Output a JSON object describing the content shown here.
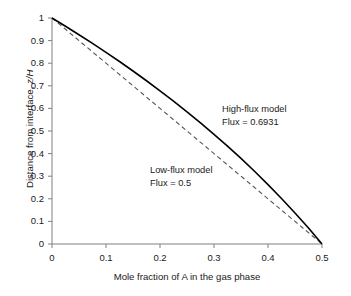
{
  "chart_data": {
    "type": "line",
    "title": "",
    "xlabel": "Mole fraction of A in the gas phase",
    "ylabel": "Distance from interface, z/H",
    "ylabel_plain": "Distance from interface, ",
    "ylabel_italic": "z/H",
    "xlim": [
      0,
      0.5
    ],
    "ylim": [
      0,
      1
    ],
    "grid": false,
    "legend_position": "none",
    "xticks": [
      "0",
      "0.1",
      "0.2",
      "0.3",
      "0.4",
      "0.5"
    ],
    "xtick_values": [
      0,
      0.1,
      0.2,
      0.3,
      0.4,
      0.5
    ],
    "yticks": [
      "0",
      "0.1",
      "0.2",
      "0.3",
      "0.4",
      "0.5",
      "0.6",
      "0.7",
      "0.8",
      "0.9",
      "1"
    ],
    "ytick_values": [
      0,
      0.1,
      0.2,
      0.3,
      0.4,
      0.5,
      0.6,
      0.7,
      0.8,
      0.9,
      1
    ],
    "series": [
      {
        "name": "High-flux model",
        "style": "solid",
        "color": "#000000",
        "x": [
          0,
          0.025,
          0.05,
          0.075,
          0.1,
          0.125,
          0.15,
          0.175,
          0.2,
          0.225,
          0.25,
          0.275,
          0.3,
          0.325,
          0.35,
          0.375,
          0.4,
          0.425,
          0.45,
          0.475,
          0.5
        ],
        "values": [
          1,
          0.9635,
          0.926,
          0.8875,
          0.848,
          0.8074,
          0.7655,
          0.7224,
          0.678,
          0.6322,
          0.585,
          0.5361,
          0.4855,
          0.433,
          0.3785,
          0.3219,
          0.263,
          0.2016,
          0.1375,
          0.0704,
          0
        ]
      },
      {
        "name": "Low-flux model",
        "style": "dashed",
        "color": "#555555",
        "x": [
          0,
          0.05,
          0.1,
          0.15,
          0.2,
          0.25,
          0.3,
          0.35,
          0.4,
          0.45,
          0.5
        ],
        "values": [
          1,
          0.9,
          0.8,
          0.7,
          0.6,
          0.5,
          0.4,
          0.3,
          0.2,
          0.1,
          0
        ]
      }
    ],
    "annotations": [
      {
        "id": "high-flux",
        "line1": "High-flux model",
        "line2": "Flux = 0.6931",
        "x": 222,
        "y": 103
      },
      {
        "id": "low-flux",
        "line1": "Low-flux model",
        "line2": "Flux = 0.5",
        "x": 150,
        "y": 164
      }
    ]
  },
  "axes": {
    "axis_color": "#808080",
    "tick_color": "#808080"
  }
}
